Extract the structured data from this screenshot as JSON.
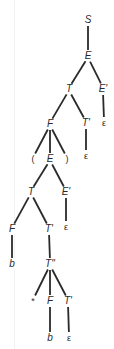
{
  "diagram": {
    "type": "parse-tree",
    "stroke_color": "#2a2a2a",
    "background": "#ffffff",
    "nodes": [
      {
        "id": "n0",
        "label": "S",
        "x": 88,
        "y": 20,
        "kind": "nt"
      },
      {
        "id": "n1",
        "label": "E",
        "x": 88,
        "y": 56,
        "kind": "nt"
      },
      {
        "id": "n2",
        "label": "T",
        "x": 69,
        "y": 89,
        "kind": "nt"
      },
      {
        "id": "n3",
        "label": "E'",
        "x": 103,
        "y": 89,
        "kind": "nt"
      },
      {
        "id": "n4",
        "label": "F",
        "x": 50,
        "y": 124,
        "kind": "nt"
      },
      {
        "id": "n5",
        "label": "T'",
        "x": 86,
        "y": 123,
        "kind": "nt"
      },
      {
        "id": "n6",
        "label": "ε",
        "x": 104,
        "y": 123,
        "kind": "eps"
      },
      {
        "id": "n7",
        "label": "(",
        "x": 33,
        "y": 159,
        "kind": "sym"
      },
      {
        "id": "n8",
        "label": "E",
        "x": 50,
        "y": 159,
        "kind": "nt"
      },
      {
        "id": "n9",
        "label": ")",
        "x": 67,
        "y": 159,
        "kind": "sym"
      },
      {
        "id": "n10",
        "label": "ε",
        "x": 86,
        "y": 156,
        "kind": "eps"
      },
      {
        "id": "n11",
        "label": "T",
        "x": 31,
        "y": 192,
        "kind": "nt"
      },
      {
        "id": "n12",
        "label": "E'",
        "x": 66,
        "y": 192,
        "kind": "nt"
      },
      {
        "id": "n13",
        "label": "F",
        "x": 12,
        "y": 229,
        "kind": "nt"
      },
      {
        "id": "n14",
        "label": "T'",
        "x": 49,
        "y": 229,
        "kind": "nt"
      },
      {
        "id": "n15",
        "label": "ε",
        "x": 66,
        "y": 227,
        "kind": "eps"
      },
      {
        "id": "n16",
        "label": "b",
        "x": 12,
        "y": 264,
        "kind": "nt"
      },
      {
        "id": "n17",
        "label": "T''",
        "x": 50,
        "y": 264,
        "kind": "nt"
      },
      {
        "id": "n18",
        "label": "*",
        "x": 33,
        "y": 301,
        "kind": "sym"
      },
      {
        "id": "n19",
        "label": "F",
        "x": 50,
        "y": 301,
        "kind": "nt"
      },
      {
        "id": "n20",
        "label": "T'",
        "x": 68,
        "y": 301,
        "kind": "nt"
      },
      {
        "id": "n21",
        "label": "b",
        "x": 50,
        "y": 338,
        "kind": "nt"
      },
      {
        "id": "n22",
        "label": "ε",
        "x": 69,
        "y": 338,
        "kind": "eps"
      }
    ],
    "edges": [
      [
        "n0",
        "n1"
      ],
      [
        "n1",
        "n2"
      ],
      [
        "n1",
        "n3"
      ],
      [
        "n2",
        "n4"
      ],
      [
        "n2",
        "n5"
      ],
      [
        "n3",
        "n6"
      ],
      [
        "n4",
        "n7"
      ],
      [
        "n4",
        "n8"
      ],
      [
        "n4",
        "n9"
      ],
      [
        "n5",
        "n10"
      ],
      [
        "n8",
        "n11"
      ],
      [
        "n8",
        "n12"
      ],
      [
        "n11",
        "n13"
      ],
      [
        "n11",
        "n14"
      ],
      [
        "n12",
        "n15"
      ],
      [
        "n13",
        "n16"
      ],
      [
        "n14",
        "n17"
      ],
      [
        "n17",
        "n18"
      ],
      [
        "n17",
        "n19"
      ],
      [
        "n17",
        "n20"
      ],
      [
        "n19",
        "n21"
      ],
      [
        "n20",
        "n22"
      ]
    ]
  }
}
